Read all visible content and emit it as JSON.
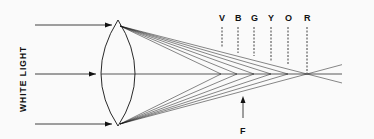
{
  "diagram": {
    "side_label": "WHITE LIGHT",
    "focus_label": "F",
    "color_labels": [
      "V",
      "B",
      "G",
      "Y",
      "O",
      "R"
    ],
    "color_label_x": [
      222,
      238,
      254,
      271,
      288,
      307
    ],
    "focal_x": [
      221,
      237,
      254,
      271,
      288,
      307
    ],
    "axis_y": 74,
    "lens": {
      "cx": 118,
      "top_y": 20,
      "bottom_y": 126,
      "half_width": 17
    },
    "colors": {
      "line": "#111111",
      "background": "#fafafa"
    }
  }
}
